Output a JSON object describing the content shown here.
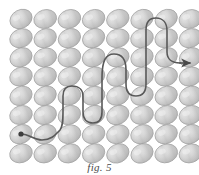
{
  "figure": {
    "caption": "fig. 5",
    "title": "fig. 5",
    "background_color": "#ffffff"
  },
  "grid": {
    "name": "ellipse-grid",
    "columns": 8,
    "rows": 8,
    "origin_x": 21,
    "origin_y": 19,
    "step_x": 24.2,
    "step_y": 19.2,
    "ellipse_rx": 11.5,
    "ellipse_ry": 9.2,
    "tilt_degrees": -22,
    "fill_light": "#e4e4e4",
    "fill_mid": "#c9c9c9",
    "fill_dark": "#a9a9a9",
    "stroke_color": "#9a9a9a",
    "stroke_width": 0.7,
    "texture_color": "#b4b4b4"
  },
  "path": {
    "name": "serpentine-path",
    "stroke_color": "#595959",
    "stroke_width": 1.6,
    "start_marker": {
      "label": "start-dot",
      "cx": 21,
      "cy": 134,
      "r": 2.6,
      "color": "#3c3c3c"
    },
    "arrow": {
      "label": "exit-arrow",
      "color": "#4a4a4a",
      "tip_x": 192,
      "tip_y": 63
    },
    "d": "M 21 134 C 30 134 33 140 42 140 C 52 140 56 134 60 130 C 63 126 63 120 63 112 L 63 96 C 63 90 66 86 72 86 C 79 86 83 90 83 96 L 83 112 C 83 119 87 123 93 123 C 99 123 102 119 102 112 L 102 78 C 102 60 106 54 114 54 C 122 54 126 60 126 70 L 126 84 C 126 92 130 96 136 96 C 142 96 146 92 146 84 L 146 30 C 146 22 150 18 156 18 C 163 18 167 23 167 31 L 167 52 C 167 59 172 63 180 63 L 190 63"
  },
  "colors": {
    "line": "#595959",
    "stone_base": "#cccccc",
    "caption_text": "#4a4a4a"
  }
}
